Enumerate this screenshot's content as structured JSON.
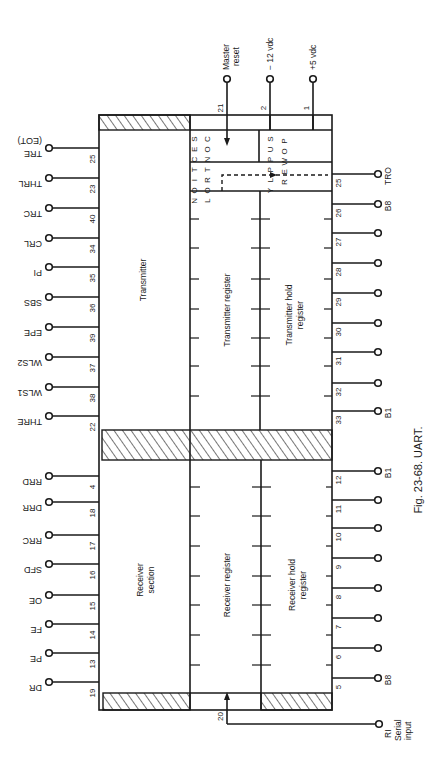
{
  "figure": {
    "caption": "Fig. 23-68. UART.",
    "orientation": "rotated 90 degrees clockwise"
  },
  "blocks": {
    "transmitter": "Transmitter",
    "transmitter_register": "Transmitter register",
    "transmitter_hold_register_line1": "Transmitter hold",
    "transmitter_hold_register_line2": "register",
    "receiver_section_line1": "Receiver",
    "receiver_section_line2": "section",
    "receiver_register": "Receiver register",
    "receiver_hold_register_line1": "Receiver hold",
    "receiver_hold_register_line2": "register",
    "control_section_col1": [
      "C",
      "O",
      "N",
      "T",
      "R",
      "O",
      "L"
    ],
    "control_section_col2": [
      "S",
      "E",
      "C",
      "T",
      "I",
      "O",
      "N"
    ],
    "power_supply_col1": [
      "P",
      "O",
      "W",
      "E",
      "R"
    ],
    "power_supply_col2": [
      "S",
      "U",
      "P",
      "P",
      "L",
      "Y"
    ]
  },
  "left_pins": [
    {
      "pin": "25",
      "label": "TRE",
      "sublabel": "(EOT)",
      "y": 148
    },
    {
      "pin": "23",
      "label": "THRL",
      "y": 178
    },
    {
      "pin": "40",
      "label": "TRC",
      "y": 208
    },
    {
      "pin": "34",
      "label": "CRL",
      "y": 238
    },
    {
      "pin": "35",
      "label": "PI",
      "y": 267
    },
    {
      "pin": "36",
      "label": "SBS",
      "y": 297
    },
    {
      "pin": "39",
      "label": "EPE",
      "y": 327
    },
    {
      "pin": "37",
      "label": "WLS2",
      "y": 357
    },
    {
      "pin": "38",
      "label": "WLS1",
      "y": 387
    },
    {
      "pin": "22",
      "label": "THRE",
      "y": 416
    },
    {
      "pin": "4",
      "label": "RRD",
      "y": 476
    },
    {
      "pin": "18",
      "label": "DRR",
      "y": 502
    },
    {
      "pin": "17",
      "label": "RRC",
      "y": 535
    },
    {
      "pin": "16",
      "label": "SFD",
      "y": 564
    },
    {
      "pin": "15",
      "label": "OE",
      "y": 595
    },
    {
      "pin": "14",
      "label": "FE",
      "y": 624
    },
    {
      "pin": "13",
      "label": "PE",
      "y": 653
    },
    {
      "pin": "19",
      "label": "DR",
      "y": 682
    }
  ],
  "right_pins_transmit": [
    {
      "pin": "25",
      "label": "TRO",
      "y": 174
    },
    {
      "pin": "26",
      "label": "B8",
      "y": 204
    },
    {
      "pin": "27",
      "label": "",
      "y": 233
    },
    {
      "pin": "28",
      "label": "",
      "y": 263
    },
    {
      "pin": "29",
      "label": "",
      "y": 293
    },
    {
      "pin": "30",
      "label": "",
      "y": 323
    },
    {
      "pin": "31",
      "label": "",
      "y": 352
    },
    {
      "pin": "32",
      "label": "",
      "y": 383
    },
    {
      "pin": "33",
      "label": "B1",
      "y": 411
    }
  ],
  "right_pins_receive": [
    {
      "pin": "12",
      "label": "B1",
      "y": 471
    },
    {
      "pin": "11",
      "label": "",
      "y": 500
    },
    {
      "pin": "10",
      "label": "",
      "y": 528
    },
    {
      "pin": "9",
      "label": "",
      "y": 558
    },
    {
      "pin": "8",
      "label": "",
      "y": 588
    },
    {
      "pin": "7",
      "label": "",
      "y": 618
    },
    {
      "pin": "6",
      "label": "",
      "y": 648
    },
    {
      "pin": "5",
      "label": "B8",
      "y": 678
    }
  ],
  "top_pins": [
    {
      "pin": "21",
      "label": "Master reset",
      "label_line1": "Master",
      "label_line2": "reset",
      "x": 227
    },
    {
      "pin": "2",
      "label": "− 12 vdc",
      "x": 270
    },
    {
      "pin": "1",
      "label": "+5 vdc",
      "x": 313
    }
  ],
  "bottom_pin": {
    "pin": "20",
    "label": "RI",
    "label_line2": "Serial",
    "label_line3": "input"
  },
  "colors": {
    "ink": "#1a1a1a",
    "paper": "#ffffff"
  }
}
